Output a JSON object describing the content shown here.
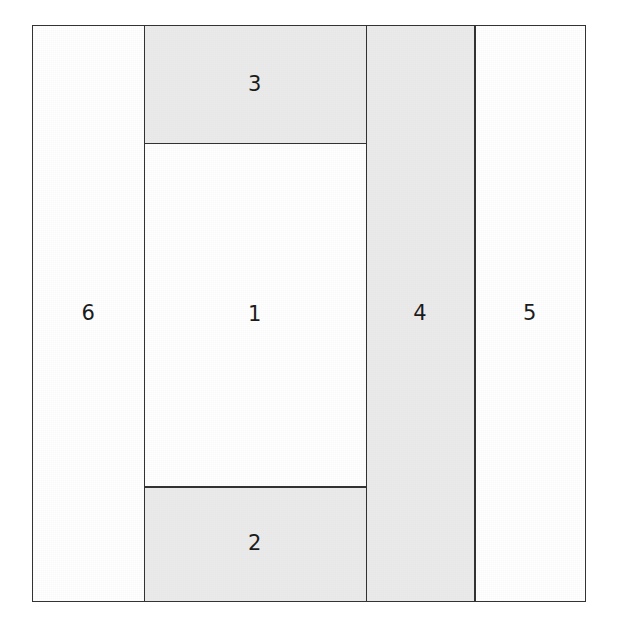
{
  "diagram": {
    "type": "partitioned-rectangle",
    "canvas": {
      "width": 619,
      "height": 631,
      "background": "#ffffff"
    },
    "frame": {
      "x": 32,
      "y": 25,
      "width": 554,
      "height": 577
    },
    "colors": {
      "stroke": "#333333",
      "fill_shaded": "#ebebeb",
      "fill_plain": "#ffffff",
      "label_text": "#1b1b1b"
    },
    "grid_lines": {
      "vertical_x": [
        143,
        366,
        475
      ],
      "horizontal_y": [
        142,
        487
      ]
    },
    "regions": [
      {
        "id": "region-1",
        "label": "1",
        "shaded": false,
        "x_pct": 20.04,
        "y_pct": 20.28,
        "w_pct": 40.25,
        "h_pct": 59.79
      },
      {
        "id": "region-2",
        "label": "2",
        "shaded": true,
        "x_pct": 20.04,
        "y_pct": 80.07,
        "w_pct": 40.25,
        "h_pct": 19.93
      },
      {
        "id": "region-3",
        "label": "3",
        "shaded": true,
        "x_pct": 20.04,
        "y_pct": 0.0,
        "w_pct": 40.25,
        "h_pct": 20.28
      },
      {
        "id": "region-4",
        "label": "4",
        "shaded": true,
        "x_pct": 60.29,
        "y_pct": 0.0,
        "w_pct": 19.68,
        "h_pct": 100.0
      },
      {
        "id": "region-5",
        "label": "5",
        "shaded": false,
        "x_pct": 79.96,
        "y_pct": 0.0,
        "w_pct": 20.04,
        "h_pct": 100.0
      },
      {
        "id": "region-6",
        "label": "6",
        "shaded": false,
        "x_pct": 0.0,
        "y_pct": 0.0,
        "w_pct": 20.04,
        "h_pct": 100.0
      }
    ],
    "dividers": [
      {
        "id": "divider-v-6-1",
        "orientation": "vertical",
        "pos_pct": 20.04,
        "start_pct": 0.0,
        "span_pct": 100.0
      },
      {
        "id": "divider-v-1-4",
        "orientation": "vertical",
        "pos_pct": 60.29,
        "start_pct": 0.0,
        "span_pct": 100.0
      },
      {
        "id": "divider-v-4-5",
        "orientation": "vertical",
        "pos_pct": 79.96,
        "start_pct": 0.0,
        "span_pct": 100.0
      },
      {
        "id": "divider-h-3-1",
        "orientation": "horizontal",
        "pos_pct": 20.28,
        "start_pct": 20.04,
        "span_pct": 40.25
      },
      {
        "id": "divider-h-1-2",
        "orientation": "horizontal",
        "pos_pct": 80.07,
        "start_pct": 20.04,
        "span_pct": 40.25
      }
    ]
  }
}
